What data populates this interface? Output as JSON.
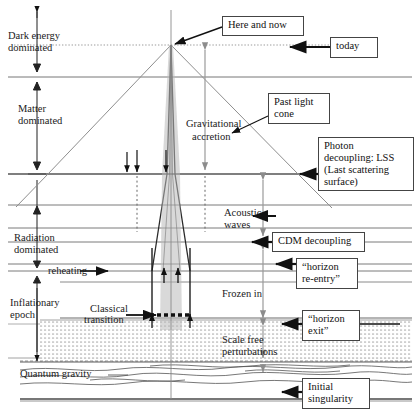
{
  "figure": {
    "type": "diagram",
    "background": "#ffffff",
    "line_color": "#1a1a1a",
    "grey_color": "#8c8c8c",
    "width": 419,
    "height": 414
  },
  "era_labels": [
    {
      "id": "dark-energy",
      "line1": "Dark energy",
      "line2": "dominated",
      "x": 8,
      "y": 30
    },
    {
      "id": "matter",
      "line1": "Matter",
      "line2": "dominated",
      "x": 18,
      "y": 103
    },
    {
      "id": "radiation",
      "line1": "Radiation",
      "line2": "dominated",
      "x": 14,
      "y": 232
    },
    {
      "id": "inflationary",
      "line1": "Inflationary",
      "line2": "epoch",
      "x": 10,
      "y": 297
    }
  ],
  "inline_labels": [
    {
      "id": "reheating",
      "text": "reheating",
      "x": 36,
      "y": 272
    },
    {
      "id": "classical-transition-1",
      "text": "Classical",
      "x": 90,
      "y": 307
    },
    {
      "id": "classical-transition-2",
      "text": "transition",
      "x": 86,
      "y": 320
    },
    {
      "id": "quantum-gravity",
      "text": "Quantum gravity",
      "x": 20,
      "y": 374
    },
    {
      "id": "gravitational-accretion-1",
      "text": "Gravitational",
      "x": 186,
      "y": 120
    },
    {
      "id": "gravitational-accretion-2",
      "text": "accretion",
      "x": 192,
      "y": 133
    },
    {
      "id": "acoustic-waves-1",
      "text": "Acoustic",
      "x": 224,
      "y": 210
    },
    {
      "id": "acoustic-waves-2",
      "text": "waves",
      "x": 224,
      "y": 222
    },
    {
      "id": "frozen-in",
      "text": "Frozen in",
      "x": 222,
      "y": 292
    },
    {
      "id": "scale-free-1",
      "text": "Scale free",
      "x": 222,
      "y": 337
    },
    {
      "id": "scale-free-2",
      "text": "perturbations",
      "x": 222,
      "y": 350
    }
  ],
  "callouts": [
    {
      "id": "here-and-now",
      "text": "Here and now",
      "x": 222,
      "y": 16,
      "w": 82,
      "h": 20
    },
    {
      "id": "today",
      "text": "today",
      "x": 330,
      "y": 37,
      "w": 48,
      "h": 21
    },
    {
      "id": "past-light-cone",
      "text": "Past light\ncone",
      "x": 268,
      "y": 93,
      "w": 62,
      "h": 31
    },
    {
      "id": "photon-decoupling",
      "text": "Photon\ndecoupling: LSS\n(Last scattering\nsurface)",
      "x": 318,
      "y": 137,
      "w": 96,
      "h": 54
    },
    {
      "id": "cdm-decoupling",
      "text": "CDM decoupling",
      "x": 272,
      "y": 232,
      "w": 93,
      "h": 20
    },
    {
      "id": "horizon-re-entry",
      "text": "“horizon\nre-entry”",
      "x": 296,
      "y": 258,
      "w": 62,
      "h": 31
    },
    {
      "id": "horizon-exit",
      "text": "“horizon\nexit”",
      "x": 302,
      "y": 310,
      "w": 58,
      "h": 31
    },
    {
      "id": "initial-singularity",
      "text": "Initial\nsingularity",
      "x": 302,
      "y": 378,
      "w": 68,
      "h": 31
    }
  ],
  "axis_markers": {
    "dark_energy_top_arrow": "up-arrow",
    "era_divider_arrows": "double-head-vertical",
    "left_axis_x": 37
  },
  "legend_notes": {
    "now_line_y": 45,
    "lss_line_y": 174,
    "reheating_y": 271,
    "classical_transition_y": 318,
    "quantum_gravity_top_y": 362,
    "bottom_y": 399
  }
}
